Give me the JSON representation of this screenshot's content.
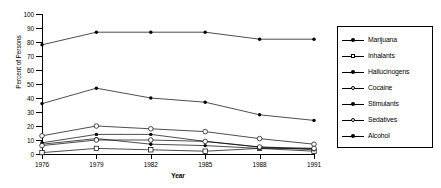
{
  "chart_data": {
    "type": "line",
    "title": "",
    "xlabel": "Year",
    "ylabel": "Percent of Persons",
    "x": [
      1976,
      1979,
      1982,
      1985,
      1988,
      1991
    ],
    "xticklabels": [
      "1976",
      "1979",
      "1982",
      "1985",
      "1988",
      "1991"
    ],
    "yticklabels": [
      "0",
      "10",
      "20",
      "30",
      "40",
      "50",
      "60",
      "70",
      "80",
      "90",
      "100"
    ],
    "yticks": [
      0,
      10,
      20,
      30,
      40,
      50,
      60,
      70,
      80,
      90,
      100
    ],
    "ylim": [
      0,
      100
    ],
    "xlim": [
      1976,
      1991
    ],
    "grid": false,
    "legend_position": "right",
    "series": [
      {
        "name": "Marijuana",
        "marker": "filled-circle",
        "values": [
          36,
          47,
          40,
          37,
          28,
          24
        ]
      },
      {
        "name": "Inhalants",
        "marker": "open-square",
        "values": [
          1,
          4,
          3,
          2,
          4,
          2
        ]
      },
      {
        "name": "Hallucinogens",
        "marker": "filled-circle",
        "values": [
          7,
          11,
          7,
          6,
          4,
          4
        ]
      },
      {
        "name": "Cocaine",
        "marker": "open-circle",
        "values": [
          13,
          20,
          18,
          16,
          11,
          7
        ]
      },
      {
        "name": "Stimulants",
        "marker": "filled-circle",
        "values": [
          8,
          14,
          14,
          9,
          5,
          3
        ]
      },
      {
        "name": "Sedatives",
        "marker": "open-circle",
        "values": [
          6,
          10,
          10,
          9,
          5,
          4
        ]
      },
      {
        "name": "Alcohol",
        "marker": "filled-circle",
        "values": [
          78,
          87,
          87,
          87,
          82,
          82
        ]
      }
    ]
  },
  "legend": {
    "items": [
      {
        "label": "Marijuana"
      },
      {
        "label": "Inhalants"
      },
      {
        "label": "Hallucinogens"
      },
      {
        "label": "Cocaine"
      },
      {
        "label": "Stimulants"
      },
      {
        "label": "Sedatives"
      },
      {
        "label": "Alcohol"
      }
    ]
  },
  "colors": {
    "line": "#000000",
    "axis": "#000000",
    "background": "#ffffff"
  }
}
